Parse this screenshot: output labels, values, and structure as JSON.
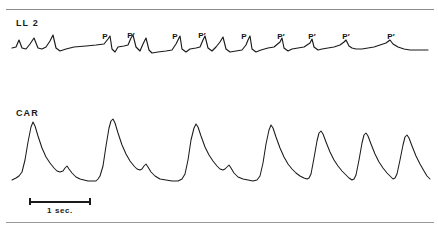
{
  "figure": {
    "type": "physiological-recording",
    "channels": [
      {
        "id": "ecg",
        "label": "LL 2"
      },
      {
        "id": "carotid",
        "label": "CAR"
      }
    ],
    "scale": {
      "label": "1 sec.",
      "value": 1,
      "unit": "sec"
    }
  },
  "chart_data": {
    "type": "line",
    "title": "",
    "xlabel": "",
    "ylabel": "",
    "grid": false,
    "legend_position": "none",
    "x_unit": "seconds",
    "seconds_per_pixel": 0.0161,
    "annotations": [
      {
        "label": "P",
        "x": 105,
        "y": 32,
        "prime": false
      },
      {
        "label": "P",
        "x": 131,
        "y": 31,
        "prime": true
      },
      {
        "label": "P",
        "x": 175,
        "y": 32,
        "prime": false
      },
      {
        "label": "P",
        "x": 202,
        "y": 31,
        "prime": true
      },
      {
        "label": "P",
        "x": 244,
        "y": 32,
        "prime": false
      },
      {
        "label": "P",
        "x": 281,
        "y": 32,
        "prime": true
      },
      {
        "label": "P",
        "x": 312,
        "y": 32,
        "prime": true
      },
      {
        "label": "P",
        "x": 346,
        "y": 32,
        "prime": true
      },
      {
        "label": "P",
        "x": 391,
        "y": 32,
        "prime": true
      }
    ],
    "series": [
      {
        "name": "LL 2",
        "baseline_y": 48,
        "points": "12,48 16,47 19,40 22,48 26,49 30,44 34,38 38,48 42,49 46,47 50,41 53,35 56,48 60,51 66,49 74,47 86,46 96,45 104,44 108,39 110,36 112,49 115,52 118,47 124,46 128,45 131,38 133,35 136,47 140,51 143,44 146,38 149,50 152,53 158,52 166,51 172,50 176,44 178,40 180,36 182,49 186,52 190,49 196,48 200,47 203,40 205,36 208,48 212,51 216,47 220,42 223,37 226,49 230,52 236,51 242,50 246,45 248,40 250,36 252,49 256,52 261,50 268,48 274,47 280,42 282,38 284,48 288,51 292,49 298,48 304,47 310,43 312,39 314,47 318,50 322,49 328,48 334,47 340,45 344,42 346,40 349,46 352,48 356,49 362,49 368,48 374,47 380,45 386,43 390,40 393,44 398,47 404,49 410,50 416,50 422,50 428,50"
      },
      {
        "name": "CAR",
        "baseline_y": 180,
        "points": "12,180 16,178 19,176 22,172 25,160 28,142 31,127 33,122 35,126 38,136 42,148 46,157 50,163 54,168 57,171 60,172 63,171 65,168 67,166 69,169 72,173 76,177 80,179 84,180 88,181 92,181 96,181 98,179 100,176 103,166 106,146 109,128 111,121 113,119 115,123 118,133 122,145 126,154 130,161 134,166 137,169 140,170 142,169 144,166 146,164 148,167 151,172 155,176 160,179 166,180 172,181 178,181 182,179 185,174 188,160 191,140 194,128 196,124 198,127 201,136 205,147 209,155 213,161 217,166 220,169 223,170 225,169 227,167 229,165 231,168 234,173 238,177 243,179 248,180 253,181 257,180 260,176 263,163 266,144 269,130 271,125 273,128 276,137 280,148 284,157 288,164 292,169 296,173 300,176 304,178 307,179 309,178 311,174 314,158 317,141 319,133 321,131 323,134 326,142 330,152 334,160 338,166 342,171 346,175 349,178 352,180 354,179 356,175 359,160 362,143 364,135 366,133 368,136 371,144 375,154 379,162 383,168 387,173 390,176 393,179 395,178 397,174 400,160 403,145 405,137 407,135 409,138 412,146 416,156 420,164 424,171 427,176 430,179"
      }
    ]
  }
}
